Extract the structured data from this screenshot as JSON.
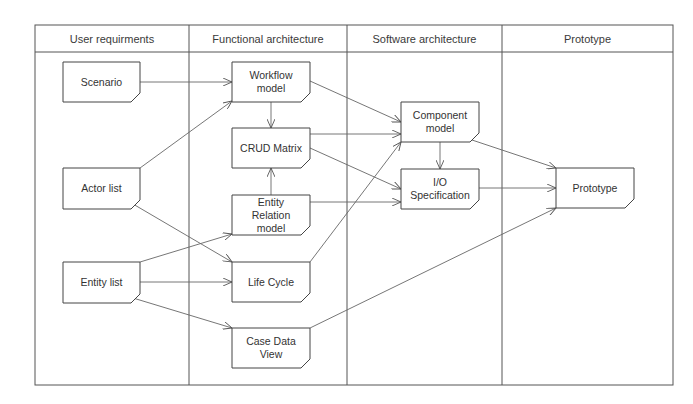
{
  "columns": [
    {
      "label": "User requirments",
      "x": 35,
      "w": 154
    },
    {
      "label": "Functional architecture",
      "x": 189,
      "w": 158
    },
    {
      "label": "Software architecture",
      "x": 347,
      "w": 155
    },
    {
      "label": "Prototype",
      "x": 502,
      "w": 171
    }
  ],
  "nodes": {
    "scenario": {
      "label": "Scenario",
      "x": 63,
      "y": 62,
      "w": 77,
      "h": 40
    },
    "actor_list": {
      "label": "Actor list",
      "x": 63,
      "y": 168,
      "w": 77,
      "h": 41
    },
    "entity_list": {
      "label": "Entity list",
      "x": 63,
      "y": 262,
      "w": 77,
      "h": 41
    },
    "workflow_model": {
      "label": "Workflow\nmodel",
      "x": 232,
      "y": 62,
      "w": 78,
      "h": 40
    },
    "crud_matrix": {
      "label": "CRUD Matrix",
      "x": 232,
      "y": 128,
      "w": 78,
      "h": 40
    },
    "entity_relation_model": {
      "label": "Entity\nRelation\nmodel",
      "x": 232,
      "y": 195,
      "w": 78,
      "h": 40
    },
    "life_cycle": {
      "label": "Life Cycle",
      "x": 232,
      "y": 262,
      "w": 78,
      "h": 40
    },
    "case_data_view": {
      "label": "Case Data\nView",
      "x": 232,
      "y": 328,
      "w": 78,
      "h": 40
    },
    "component_model": {
      "label": "Component\nmodel",
      "x": 401,
      "y": 102,
      "w": 78,
      "h": 40
    },
    "io_specification": {
      "label": "I/O\nSpecification",
      "x": 401,
      "y": 169,
      "w": 78,
      "h": 40
    },
    "prototype": {
      "label": "Prototype",
      "x": 556,
      "y": 168,
      "w": 78,
      "h": 40
    }
  },
  "edges": [
    {
      "from": "scenario",
      "to": "workflow_model",
      "x1": 140,
      "y1": 82,
      "x2": 232,
      "y2": 82
    },
    {
      "from": "actor_list",
      "to": "workflow_model",
      "x1": 140,
      "y1": 168,
      "x2": 232,
      "y2": 101
    },
    {
      "from": "actor_list",
      "to": "life_cycle",
      "x1": 133,
      "y1": 204,
      "x2": 232,
      "y2": 262
    },
    {
      "from": "entity_list",
      "to": "entity_relation_model",
      "x1": 140,
      "y1": 262,
      "x2": 232,
      "y2": 234
    },
    {
      "from": "entity_list",
      "to": "life_cycle",
      "x1": 140,
      "y1": 282,
      "x2": 232,
      "y2": 282
    },
    {
      "from": "entity_list",
      "to": "case_data_view",
      "x1": 133,
      "y1": 298,
      "x2": 232,
      "y2": 328
    },
    {
      "from": "workflow_model",
      "to": "crud_matrix",
      "x1": 271,
      "y1": 102,
      "x2": 271,
      "y2": 128
    },
    {
      "from": "entity_relation_model",
      "to": "crud_matrix",
      "x1": 271,
      "y1": 195,
      "x2": 271,
      "y2": 168
    },
    {
      "from": "workflow_model",
      "to": "component_model",
      "x1": 310,
      "y1": 81,
      "x2": 401,
      "y2": 122
    },
    {
      "from": "crud_matrix",
      "to": "component_model",
      "x1": 310,
      "y1": 134,
      "x2": 401,
      "y2": 134
    },
    {
      "from": "crud_matrix",
      "to": "io_specification",
      "x1": 310,
      "y1": 148,
      "x2": 401,
      "y2": 189
    },
    {
      "from": "entity_relation_model",
      "to": "io_specification",
      "x1": 310,
      "y1": 202,
      "x2": 401,
      "y2": 202
    },
    {
      "from": "life_cycle",
      "to": "component_model",
      "x1": 310,
      "y1": 262,
      "x2": 401,
      "y2": 142
    },
    {
      "from": "component_model",
      "to": "io_specification",
      "x1": 440,
      "y1": 142,
      "x2": 440,
      "y2": 169
    },
    {
      "from": "component_model",
      "to": "prototype",
      "x1": 472,
      "y1": 140,
      "x2": 556,
      "y2": 168
    },
    {
      "from": "io_specification",
      "to": "prototype",
      "x1": 479,
      "y1": 188,
      "x2": 556,
      "y2": 188
    },
    {
      "from": "case_data_view",
      "to": "prototype",
      "x1": 310,
      "y1": 328,
      "x2": 556,
      "y2": 208
    }
  ],
  "colors": {
    "line": "#555555",
    "text": "#333333",
    "background": "#ffffff"
  }
}
